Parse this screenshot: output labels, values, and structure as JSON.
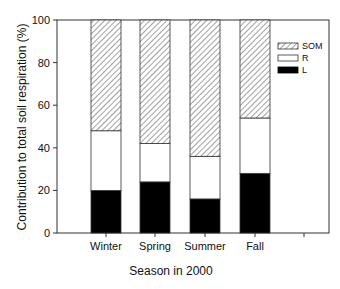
{
  "chart_data": {
    "type": "bar",
    "stacked": true,
    "title": "",
    "xlabel": "Season in 2000",
    "ylabel": "Contribution to total soil respiration (%)",
    "ylim": [
      0,
      100
    ],
    "yticks": [
      0,
      20,
      40,
      60,
      80,
      100
    ],
    "grid": false,
    "legend_position": "upper right (inside plot)",
    "categories": [
      "Winter",
      "Spring",
      "Summer",
      "Fall"
    ],
    "series": [
      {
        "name": "L",
        "pattern": "solid-black",
        "values": [
          20,
          24,
          16,
          28
        ]
      },
      {
        "name": "R",
        "pattern": "white",
        "values": [
          28,
          18,
          20,
          26
        ]
      },
      {
        "name": "SOM",
        "pattern": "diagonal-hatch",
        "values": [
          52,
          58,
          64,
          46
        ]
      }
    ]
  },
  "legend": {
    "items": [
      {
        "label": "SOM",
        "pattern": "hatch"
      },
      {
        "label": "R",
        "pattern": "white"
      },
      {
        "label": "L",
        "pattern": "black"
      }
    ]
  },
  "colors": {
    "L": "#000000",
    "R": "#ffffff",
    "SOM_stroke": "#333333",
    "axis": "#333333"
  }
}
